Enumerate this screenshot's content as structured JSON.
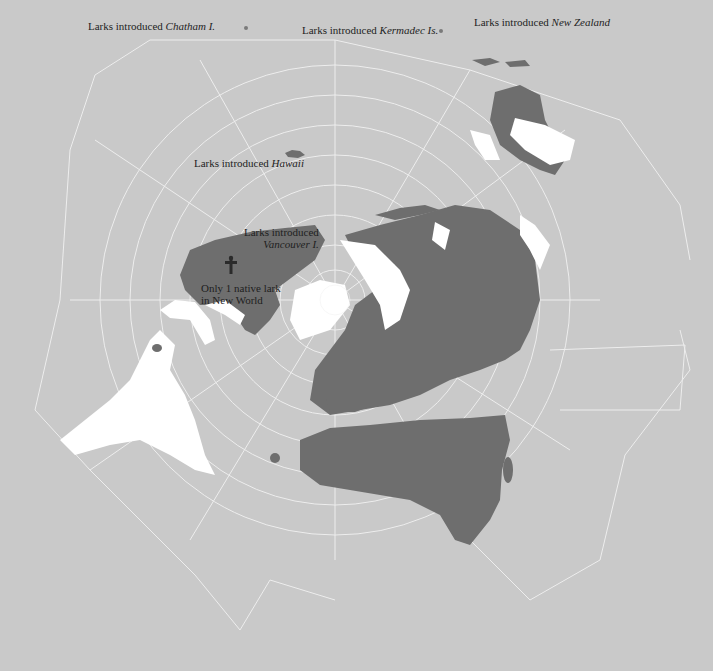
{
  "map": {
    "type": "star-shaped polar projection world map",
    "colors": {
      "background": "#c9c9c9",
      "grid": "#f2f2f2",
      "lark_range": "#6e6e6e",
      "land_no_larks": "#ffffff",
      "text": "#1e1e1e"
    },
    "legend_meaning": {
      "dark_gray": "range of larks",
      "white": "land without larks"
    }
  },
  "labels": {
    "chatham": {
      "prefix": "Larks introduced",
      "place": "Chatham I."
    },
    "kermadec": {
      "prefix": "Larks introduced",
      "place": "Kermadec Is."
    },
    "new_zealand": {
      "prefix": "Larks introduced",
      "place": "New Zealand"
    },
    "hawaii": {
      "prefix": "Larks introduced",
      "place": "Hawaii"
    },
    "vancouver": {
      "prefix": "Larks introduced",
      "place": "Vancouver I."
    },
    "new_world": {
      "line1": "Only 1 native lark",
      "line2": "in New World"
    }
  },
  "icons": {
    "lark_marker": "dagger-shaped lark symbol over North America"
  }
}
